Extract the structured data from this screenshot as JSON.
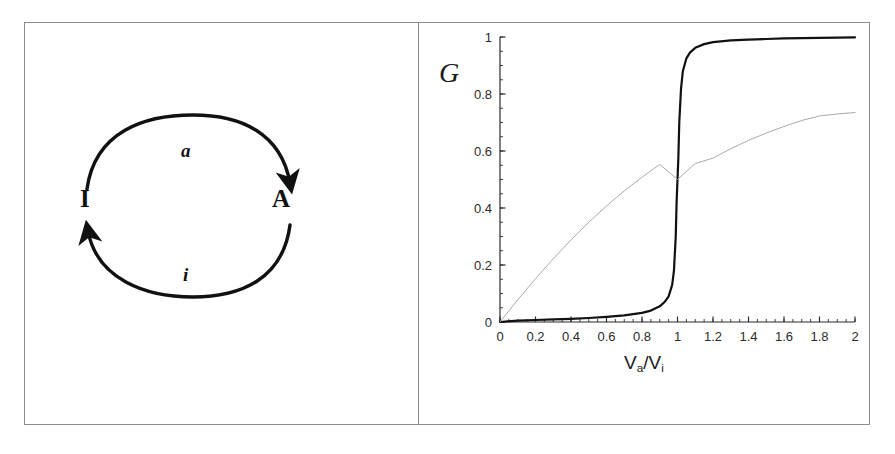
{
  "figure": {
    "panels": [
      {
        "id": "left",
        "name": "activation-inactivation-cycle"
      },
      {
        "id": "right",
        "name": "response-curves-plot"
      }
    ]
  },
  "diagram": {
    "nodes": [
      {
        "id": "inactive",
        "label": "I"
      },
      {
        "id": "active",
        "label": "A"
      }
    ],
    "edges": [
      {
        "id": "activation",
        "label": "a",
        "from": "I",
        "to": "A",
        "position": "top"
      },
      {
        "id": "inactivation",
        "label": "i",
        "from": "A",
        "to": "I",
        "position": "bottom"
      }
    ],
    "stroke_color": "#111111"
  },
  "chart_data": {
    "type": "line",
    "title": "",
    "xlabel": "Va/Vi",
    "xlabel_parts": {
      "base1": "V",
      "sub1": "a",
      "slash": "/",
      "base2": "V",
      "sub2": "i"
    },
    "ylabel": "G",
    "xlim": [
      0,
      2
    ],
    "ylim": [
      0,
      1
    ],
    "xticks": [
      0,
      0.2,
      0.4,
      0.6,
      0.8,
      1,
      1.2,
      1.4,
      1.6,
      1.8,
      2
    ],
    "xticklabels": [
      "0",
      "0.2",
      "0.4",
      "0.6",
      "0.8",
      "1",
      "1.2",
      "1.4",
      "1.6",
      "1.8",
      "2"
    ],
    "yticks": [
      0,
      0.2,
      0.4,
      0.6,
      0.8,
      1
    ],
    "yticklabels": [
      "0",
      "0.2",
      "0.4",
      "0.6",
      "0.8",
      "1"
    ],
    "minor_tick_step": 0.05,
    "grid": false,
    "legend": "none",
    "series": [
      {
        "name": "ultrasensitive",
        "style": "solid-thick",
        "color": "#111111",
        "width": 2.2,
        "description": "Zero-order ultrasensitive (Goldbeter-Koshland) switch-like response, steps from ~0 to ~1 at Va/Vi = 1",
        "x": [
          0,
          0.1,
          0.2,
          0.3,
          0.4,
          0.5,
          0.6,
          0.7,
          0.8,
          0.85,
          0.9,
          0.93,
          0.95,
          0.97,
          0.98,
          0.99,
          0.995,
          1.0,
          1.005,
          1.01,
          1.02,
          1.03,
          1.05,
          1.07,
          1.1,
          1.15,
          1.2,
          1.3,
          1.4,
          1.5,
          1.6,
          1.7,
          1.8,
          1.9,
          2.0
        ],
        "y": [
          0.0,
          0.005,
          0.007,
          0.009,
          0.011,
          0.014,
          0.018,
          0.023,
          0.032,
          0.04,
          0.055,
          0.072,
          0.09,
          0.13,
          0.18,
          0.3,
          0.42,
          0.5,
          0.58,
          0.7,
          0.82,
          0.88,
          0.925,
          0.945,
          0.962,
          0.975,
          0.982,
          0.988,
          0.991,
          0.993,
          0.995,
          0.996,
          0.997,
          0.998,
          0.999
        ]
      },
      {
        "name": "hyperbolic",
        "style": "solid-thin",
        "color": "#aaaaaa",
        "width": 1.0,
        "description": "Michaelis-Menten / hyperbolic response G = x/(1+x), passes through 0.5 at Va/Vi = 1, reaches ~0.735 at Va/Vi = 2",
        "x": [
          0,
          0.1,
          0.2,
          0.3,
          0.4,
          0.5,
          0.6,
          0.7,
          0.8,
          0.9,
          1.0,
          1.1,
          1.2,
          1.3,
          1.4,
          1.5,
          1.6,
          1.7,
          1.8,
          1.9,
          2.0
        ],
        "y": [
          0.0,
          0.078,
          0.152,
          0.222,
          0.288,
          0.35,
          0.407,
          0.46,
          0.508,
          0.553,
          0.5,
          0.556,
          0.575,
          0.608,
          0.637,
          0.663,
          0.686,
          0.707,
          0.723,
          0.73,
          0.735
        ]
      }
    ],
    "axis_color": "#2b2b2b"
  }
}
